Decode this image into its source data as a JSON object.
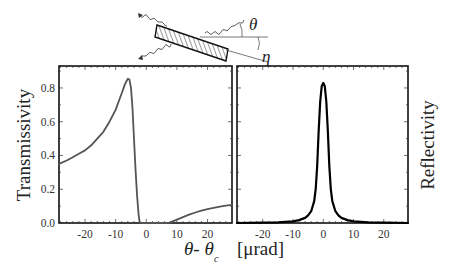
{
  "figure": {
    "schematic": {
      "angle_labels": {
        "theta": "θ",
        "eta": "η"
      }
    },
    "xlabel": {
      "var": "θ- θ",
      "sub": "c",
      "unit": "[μrad]"
    }
  },
  "chart_data": [
    {
      "type": "line",
      "title": "",
      "xlabel": "θ- θc [μrad]",
      "ylabel": "Transmissivity",
      "xlim": [
        -28.5,
        28
      ],
      "ylim": [
        0,
        0.93
      ],
      "xticks": [
        -20,
        -10,
        0,
        10,
        20
      ],
      "xtick_labels": [
        "-20",
        "-10",
        "0",
        "10",
        "20"
      ],
      "yticks": [
        0.0,
        0.2,
        0.4,
        0.6,
        0.8
      ],
      "ytick_labels": [
        "0.0",
        "0.2",
        "0.4",
        "0.6",
        "0.8"
      ],
      "grid": false,
      "line_color": "#555555",
      "series": [
        {
          "name": "Transmissivity",
          "x": [
            -28.5,
            -26,
            -24,
            -22,
            -20,
            -18,
            -16,
            -14,
            -12,
            -10,
            -9,
            -8,
            -7,
            -6.5,
            -6,
            -5.5,
            -5,
            -4.5,
            -4,
            -3.5,
            -3,
            -2.5,
            -2.2,
            -2,
            0,
            2,
            4,
            6,
            7,
            8,
            10,
            12,
            14,
            16,
            18,
            20,
            22,
            24,
            26,
            28
          ],
          "y": [
            0.35,
            0.37,
            0.39,
            0.41,
            0.43,
            0.46,
            0.5,
            0.54,
            0.6,
            0.67,
            0.72,
            0.77,
            0.82,
            0.84,
            0.855,
            0.85,
            0.8,
            0.68,
            0.5,
            0.32,
            0.16,
            0.05,
            0.01,
            0.0,
            0.0,
            0.0,
            0.0,
            0.0,
            0.0,
            0.005,
            0.02,
            0.035,
            0.05,
            0.062,
            0.073,
            0.082,
            0.09,
            0.097,
            0.103,
            0.108
          ]
        }
      ]
    },
    {
      "type": "line",
      "title": "",
      "xlabel": "θ- θc [μrad]",
      "ylabel": "Reflectivity",
      "xlim": [
        -28.5,
        28
      ],
      "ylim": [
        0,
        0.93
      ],
      "xticks": [
        -20,
        -10,
        0,
        10,
        20
      ],
      "xtick_labels": [
        "-20",
        "-10",
        "0",
        "10",
        "20"
      ],
      "yticks": [
        0.0,
        0.2,
        0.4,
        0.6,
        0.8
      ],
      "grid": false,
      "line_color": "#000000",
      "series": [
        {
          "name": "Reflectivity",
          "x": [
            -28.5,
            -20,
            -15,
            -10,
            -8,
            -6,
            -5,
            -4,
            -3,
            -2.5,
            -2,
            -1.5,
            -1,
            -0.5,
            0,
            0.5,
            1,
            1.5,
            2,
            2.5,
            3,
            4,
            5,
            6,
            8,
            10,
            15,
            20,
            28
          ],
          "y": [
            0.0,
            0.002,
            0.004,
            0.01,
            0.017,
            0.03,
            0.045,
            0.07,
            0.13,
            0.2,
            0.34,
            0.55,
            0.72,
            0.81,
            0.83,
            0.81,
            0.72,
            0.55,
            0.34,
            0.2,
            0.13,
            0.07,
            0.045,
            0.03,
            0.017,
            0.01,
            0.004,
            0.002,
            0.0
          ]
        }
      ]
    }
  ]
}
